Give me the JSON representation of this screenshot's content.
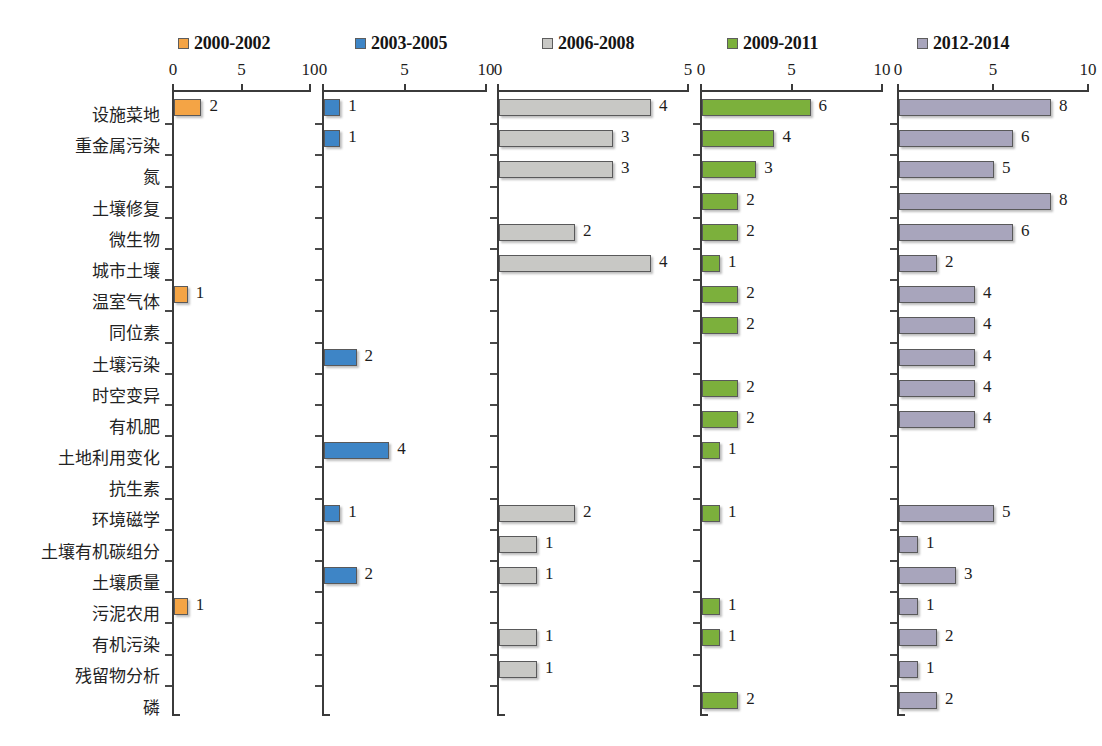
{
  "chart_data": {
    "type": "bar",
    "title": "",
    "xlabel": "",
    "ylabel": "",
    "orientation": "horizontal",
    "grid": false,
    "legend_position": "top",
    "panel_layout": "small-multiples, 5 panels sharing one category axis",
    "categories": [
      "设施菜地",
      "重金属污染",
      "氮",
      "土壤修复",
      "微生物",
      "城市土壤",
      "温室气体",
      "同位素",
      "土壤污染",
      "时空变异",
      "有机肥",
      "土地利用变化",
      "抗生素",
      "环境磁学",
      "土壤有机碳组分",
      "土壤质量",
      "污泥农用",
      "有机污染",
      "残留物分析",
      "磷"
    ],
    "series": [
      {
        "name": "2000-2002",
        "color": "#F4A445",
        "xlim": [
          0,
          10
        ],
        "ticks": [
          0,
          5,
          10
        ],
        "values": [
          2,
          null,
          null,
          null,
          null,
          null,
          1,
          null,
          null,
          null,
          null,
          null,
          null,
          null,
          null,
          null,
          1,
          null,
          null,
          null
        ]
      },
      {
        "name": "2003-2005",
        "color": "#3E85C6",
        "xlim": [
          0,
          10
        ],
        "ticks": [
          0,
          5,
          10
        ],
        "values": [
          1,
          1,
          null,
          null,
          null,
          null,
          null,
          null,
          2,
          null,
          null,
          4,
          null,
          1,
          null,
          2,
          null,
          null,
          null,
          null
        ]
      },
      {
        "name": "2006-2008",
        "color": "#C8C8C5",
        "xlim": [
          0,
          5
        ],
        "ticks": [
          0,
          5
        ],
        "values": [
          4,
          3,
          3,
          null,
          2,
          4,
          null,
          null,
          null,
          null,
          null,
          null,
          null,
          2,
          1,
          1,
          null,
          1,
          1,
          null
        ]
      },
      {
        "name": "2009-2011",
        "color": "#7CB03C",
        "xlim": [
          0,
          10
        ],
        "ticks": [
          0,
          5,
          10
        ],
        "values": [
          6,
          4,
          3,
          2,
          2,
          1,
          2,
          2,
          null,
          2,
          2,
          1,
          null,
          1,
          null,
          null,
          1,
          1,
          null,
          2
        ]
      },
      {
        "name": "2012-2014",
        "color": "#A8A5BC",
        "xlim": [
          0,
          10
        ],
        "ticks": [
          0,
          5,
          10
        ],
        "values": [
          8,
          6,
          5,
          8,
          6,
          2,
          4,
          4,
          4,
          4,
          4,
          null,
          null,
          5,
          1,
          3,
          1,
          2,
          1,
          2
        ]
      }
    ]
  },
  "legend": {
    "items": [
      {
        "label": "2000-2002",
        "color": "#F4A445",
        "left": 178
      },
      {
        "label": "2003-2005",
        "color": "#3E85C6",
        "left": 355
      },
      {
        "label": "2006-2008",
        "color": "#C8C8C5",
        "left": 542
      },
      {
        "label": "2009-2011",
        "color": "#7CB03C",
        "left": 727
      },
      {
        "label": "2012-2014",
        "color": "#A8A5BC",
        "left": 917
      }
    ]
  },
  "panels": [
    {
      "left": 172,
      "width": 148,
      "axis_px": 137
    },
    {
      "left": 322,
      "width": 173,
      "axis_px": 163
    },
    {
      "left": 497,
      "width": 200,
      "axis_px": 190
    },
    {
      "left": 700,
      "width": 190,
      "axis_px": 181
    },
    {
      "left": 897,
      "width": 200,
      "axis_px": 190
    }
  ]
}
